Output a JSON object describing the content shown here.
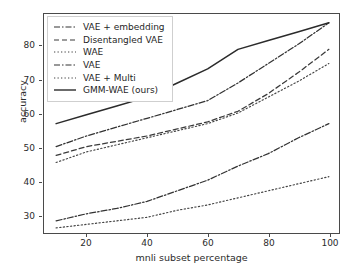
{
  "chart_data": {
    "type": "line",
    "title": "",
    "xlabel": "mnli subset percentage",
    "ylabel": "accuracy",
    "xlim": [
      6,
      104
    ],
    "ylim": [
      25.5,
      88
    ],
    "xticks": [
      20,
      40,
      60,
      80,
      100
    ],
    "yticks": [
      30,
      40,
      50,
      60,
      70,
      80
    ],
    "grid": false,
    "legend_position": "upper left",
    "x": [
      10,
      20,
      30,
      40,
      50,
      60,
      70,
      80,
      90,
      100
    ],
    "series": [
      {
        "name": "VAE + embedding",
        "style": "dashdot",
        "color": "#333333",
        "values": [
          50.5,
          53.5,
          56.0,
          58.5,
          61.0,
          63.5,
          68.5,
          74.0,
          79.5,
          85.5
        ]
      },
      {
        "name": "Disentangled VAE",
        "style": "dashed",
        "color": "#3a3a3a",
        "values": [
          48.0,
          50.5,
          52.0,
          53.5,
          55.5,
          57.5,
          60.5,
          65.5,
          71.5,
          78.0
        ]
      },
      {
        "name": "WAE",
        "style": "dotted",
        "color": "#444444",
        "values": [
          46.0,
          49.0,
          51.0,
          53.0,
          55.0,
          57.0,
          60.0,
          64.5,
          69.0,
          74.0
        ]
      },
      {
        "name": "VAE",
        "style": "dashdot",
        "color": "#333333",
        "values": [
          29.5,
          31.5,
          33.0,
          35.0,
          38.0,
          41.0,
          45.0,
          48.5,
          53.0,
          57.0
        ]
      },
      {
        "name": "VAE + Multi",
        "style": "dotted",
        "color": "#444444",
        "values": [
          27.5,
          28.5,
          29.5,
          30.5,
          32.5,
          34.0,
          36.0,
          38.0,
          40.0,
          42.0
        ]
      },
      {
        "name": "GMM-WAE (ours)",
        "style": "solid",
        "color": "#2b2b2b",
        "values": [
          57.0,
          59.5,
          62.0,
          64.5,
          68.5,
          72.5,
          78.0,
          80.5,
          83.0,
          85.5
        ]
      }
    ]
  },
  "axes": {
    "ytick_labels": [
      "80",
      "70",
      "60",
      "50",
      "40",
      "30"
    ],
    "xtick_labels": [
      "20",
      "40",
      "60",
      "80",
      "100"
    ],
    "xlabel": "mnli subset percentage",
    "ylabel": "accuracy"
  },
  "legend": {
    "items": [
      {
        "label": "VAE + embedding"
      },
      {
        "label": "Disentangled VAE"
      },
      {
        "label": "WAE"
      },
      {
        "label": "VAE"
      },
      {
        "label": "VAE + Multi"
      },
      {
        "label": "GMM-WAE (ours)"
      }
    ]
  }
}
